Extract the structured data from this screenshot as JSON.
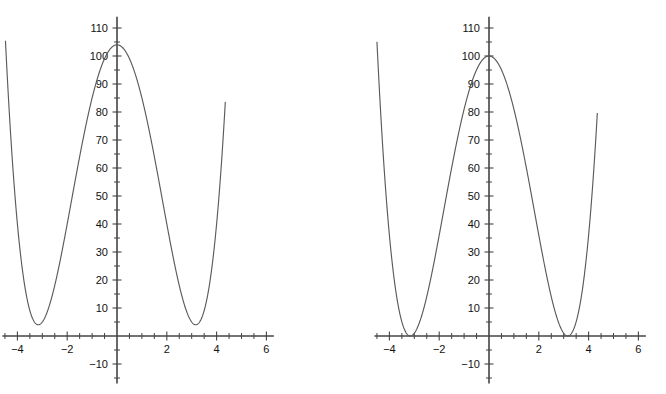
{
  "figure": {
    "background_color": "#ffffff",
    "curve_color": "#5a5a5a",
    "axis_color": "#444444",
    "label_color": "#111111",
    "panel_count": 2
  },
  "chart_data": [
    {
      "type": "line",
      "title": "",
      "subtitle": "",
      "xlabel": "",
      "ylabel": "",
      "panel": "left",
      "equation": "y = x^4 - 20x^2 + 104",
      "grid": false,
      "legend": null,
      "xlim": [
        -4.6,
        6.3
      ],
      "ylim": [
        -17,
        114
      ],
      "xticks_major": [
        -4,
        -2,
        2,
        4,
        6
      ],
      "xticklabels": [
        "-4",
        "-2",
        "2",
        "4",
        "6"
      ],
      "xtick_minor_step": 0.5,
      "yticks_major": [
        -10,
        10,
        20,
        30,
        40,
        50,
        60,
        70,
        80,
        90,
        100,
        110
      ],
      "yticklabels": [
        "-10",
        "10",
        "20",
        "30",
        "40",
        "50",
        "60",
        "70",
        "80",
        "90",
        "100",
        "110"
      ],
      "ytick_minor_step": 5,
      "domain": [
        -4.48,
        4.35
      ],
      "local_maximum": {
        "x": 0,
        "y": 104
      },
      "local_minima": [
        {
          "x": -3.162,
          "y": 4
        },
        {
          "x": 3.162,
          "y": 4
        }
      ],
      "endpoints": [
        {
          "x": -4.48,
          "y": 111
        },
        {
          "x": 4.35,
          "y": 91
        }
      ],
      "x": [
        -4.48,
        -4.3,
        -4.1,
        -3.9,
        -3.7,
        -3.5,
        -3.3,
        -3.1,
        -2.9,
        -2.7,
        -2.5,
        -2.3,
        -2.1,
        -1.9,
        -1.7,
        -1.5,
        -1.3,
        -1.1,
        -0.9,
        -0.7,
        -0.5,
        -0.3,
        0,
        0.3,
        0.5,
        0.7,
        0.9,
        1.1,
        1.3,
        1.5,
        1.7,
        1.9,
        2.1,
        2.3,
        2.5,
        2.7,
        2.9,
        3.1,
        3.3,
        3.5,
        3.7,
        3.9,
        4.1,
        4.35
      ],
      "y": [
        107.5,
        72.2,
        46.4,
        27.0,
        13.4,
        5.9,
        4.6,
        9.9,
        21.7,
        39.4,
        62.1,
        88.4,
        116.6,
        98.3,
        78.5,
        60.1,
        44.1,
        31.1,
        21.4,
        14.6,
        8.8,
        4.1,
        104,
        4.1,
        8.8,
        14.6,
        21.4,
        31.1,
        44.1,
        60.1,
        78.5,
        98.3,
        116.6,
        88.4,
        62.1,
        39.4,
        21.7,
        9.9,
        4.6,
        5.9,
        13.4,
        27.0,
        46.4,
        91.0
      ]
    },
    {
      "type": "line",
      "title": "",
      "subtitle": "",
      "xlabel": "",
      "ylabel": "",
      "panel": "right",
      "equation": "y = (x^2 - 10)^2 = x^4 - 20x^2 + 100",
      "grid": false,
      "legend": null,
      "xlim": [
        -4.6,
        6.3
      ],
      "ylim": [
        -17,
        114
      ],
      "xticks_major": [
        -4,
        -2,
        2,
        4,
        6
      ],
      "xticklabels": [
        "-4",
        "-2",
        "2",
        "4",
        "6"
      ],
      "xtick_minor_step": 0.5,
      "yticks_major": [
        -10,
        10,
        20,
        30,
        40,
        50,
        60,
        70,
        80,
        90,
        100,
        110
      ],
      "yticklabels": [
        "-10",
        "10",
        "20",
        "30",
        "40",
        "50",
        "60",
        "70",
        "80",
        "90",
        "100",
        "110"
      ],
      "ytick_minor_step": 5,
      "domain": [
        -4.5,
        4.35
      ],
      "local_maximum": {
        "x": 0,
        "y": 100
      },
      "local_minima": [
        {
          "x": -3.162,
          "y": 0
        },
        {
          "x": 3.162,
          "y": 0
        }
      ],
      "endpoints": [
        {
          "x": -4.5,
          "y": 112
        },
        {
          "x": 4.35,
          "y": 87
        }
      ],
      "x": [
        -4.5,
        -4.3,
        -4.1,
        -3.9,
        -3.7,
        -3.5,
        -3.3,
        -3.1,
        -2.9,
        -2.7,
        -2.5,
        -2.3,
        -2.1,
        -1.9,
        -1.7,
        -1.5,
        -1.3,
        -1.1,
        -0.9,
        -0.7,
        -0.5,
        -0.3,
        0,
        0.3,
        0.5,
        0.7,
        0.9,
        1.1,
        1.3,
        1.5,
        1.7,
        1.9,
        2.1,
        2.3,
        2.5,
        2.7,
        2.9,
        3.1,
        3.3,
        3.5,
        3.7,
        3.9,
        4.1,
        4.35
      ],
      "y": [
        112.6,
        68.2,
        42.4,
        23.0,
        9.4,
        1.9,
        0.6,
        5.9,
        17.7,
        35.4,
        58.1,
        84.4,
        112.6,
        94.3,
        74.5,
        56.1,
        40.1,
        27.1,
        17.4,
        10.6,
        4.8,
        0.1,
        100,
        0.1,
        4.8,
        10.6,
        17.4,
        27.1,
        40.1,
        56.1,
        74.5,
        94.3,
        112.6,
        84.4,
        58.1,
        35.4,
        17.7,
        5.9,
        0.6,
        1.9,
        9.4,
        23.0,
        42.4,
        87.0
      ]
    }
  ]
}
